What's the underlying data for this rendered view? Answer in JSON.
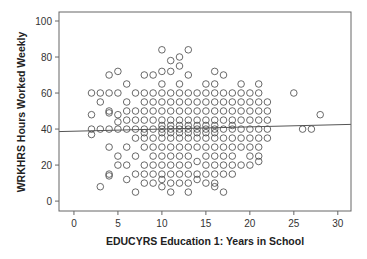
{
  "chart_data": {
    "type": "scatter",
    "title": "",
    "xlabel": "EDUCYRS Education 1: Years in School",
    "ylabel": "WRKHRS Hours Worked Weekly",
    "xlim": [
      -1.7,
      31.5
    ],
    "ylim": [
      -5.5,
      105
    ],
    "xticks": [
      0,
      5,
      10,
      15,
      20,
      25,
      30
    ],
    "yticks": [
      0,
      20,
      40,
      60,
      80,
      100
    ],
    "grid": false,
    "legend": null,
    "marker": "open-circle",
    "fit_line": {
      "type": "linear",
      "x0": -1.7,
      "y0": 38.6,
      "x1": 31.5,
      "y1": 42.6
    },
    "points": [
      [
        2,
        60
      ],
      [
        2,
        48
      ],
      [
        2,
        40
      ],
      [
        2,
        37
      ],
      [
        3,
        60
      ],
      [
        3,
        55
      ],
      [
        3,
        40
      ],
      [
        3,
        8
      ],
      [
        4,
        70
      ],
      [
        4,
        60
      ],
      [
        4,
        50
      ],
      [
        4,
        49
      ],
      [
        4,
        40
      ],
      [
        4,
        30
      ],
      [
        4,
        15
      ],
      [
        4,
        14
      ],
      [
        5,
        72
      ],
      [
        5,
        60
      ],
      [
        5,
        48
      ],
      [
        5,
        44
      ],
      [
        5,
        40
      ],
      [
        5,
        25
      ],
      [
        5,
        20
      ],
      [
        6,
        65
      ],
      [
        6,
        55
      ],
      [
        6,
        50
      ],
      [
        6,
        45
      ],
      [
        6,
        40
      ],
      [
        6,
        30
      ],
      [
        6,
        20
      ],
      [
        6,
        12
      ],
      [
        7,
        60
      ],
      [
        7,
        50
      ],
      [
        7,
        45
      ],
      [
        7,
        40
      ],
      [
        7,
        35
      ],
      [
        7,
        25
      ],
      [
        7,
        15
      ],
      [
        7,
        5
      ],
      [
        8,
        70
      ],
      [
        8,
        60
      ],
      [
        8,
        55
      ],
      [
        8,
        50
      ],
      [
        8,
        45
      ],
      [
        8,
        40
      ],
      [
        8,
        38
      ],
      [
        8,
        35
      ],
      [
        8,
        30
      ],
      [
        8,
        20
      ],
      [
        8,
        15
      ],
      [
        8,
        10
      ],
      [
        9,
        70
      ],
      [
        9,
        60
      ],
      [
        9,
        55
      ],
      [
        9,
        50
      ],
      [
        9,
        45
      ],
      [
        9,
        40
      ],
      [
        9,
        35
      ],
      [
        9,
        30
      ],
      [
        9,
        25
      ],
      [
        9,
        20
      ],
      [
        9,
        15
      ],
      [
        9,
        10
      ],
      [
        10,
        84
      ],
      [
        10,
        72
      ],
      [
        10,
        65
      ],
      [
        10,
        60
      ],
      [
        10,
        55
      ],
      [
        10,
        50
      ],
      [
        10,
        45
      ],
      [
        10,
        42
      ],
      [
        10,
        40
      ],
      [
        10,
        38
      ],
      [
        10,
        35
      ],
      [
        10,
        30
      ],
      [
        10,
        25
      ],
      [
        10,
        20
      ],
      [
        10,
        15
      ],
      [
        10,
        12
      ],
      [
        10,
        8
      ],
      [
        11,
        78
      ],
      [
        11,
        72
      ],
      [
        11,
        60
      ],
      [
        11,
        55
      ],
      [
        11,
        50
      ],
      [
        11,
        45
      ],
      [
        11,
        42
      ],
      [
        11,
        40
      ],
      [
        11,
        38
      ],
      [
        11,
        35
      ],
      [
        11,
        30
      ],
      [
        11,
        25
      ],
      [
        11,
        20
      ],
      [
        11,
        15
      ],
      [
        11,
        10
      ],
      [
        11,
        5
      ],
      [
        12,
        80
      ],
      [
        12,
        75
      ],
      [
        12,
        65
      ],
      [
        12,
        60
      ],
      [
        12,
        55
      ],
      [
        12,
        50
      ],
      [
        12,
        45
      ],
      [
        12,
        42
      ],
      [
        12,
        40
      ],
      [
        12,
        38
      ],
      [
        12,
        35
      ],
      [
        12,
        30
      ],
      [
        12,
        25
      ],
      [
        12,
        20
      ],
      [
        12,
        15
      ],
      [
        12,
        10
      ],
      [
        13,
        84
      ],
      [
        13,
        70
      ],
      [
        13,
        60
      ],
      [
        13,
        55
      ],
      [
        13,
        50
      ],
      [
        13,
        45
      ],
      [
        13,
        42
      ],
      [
        13,
        40
      ],
      [
        13,
        38
      ],
      [
        13,
        35
      ],
      [
        13,
        30
      ],
      [
        13,
        25
      ],
      [
        13,
        20
      ],
      [
        13,
        15
      ],
      [
        13,
        10
      ],
      [
        13,
        5
      ],
      [
        14,
        60
      ],
      [
        14,
        55
      ],
      [
        14,
        50
      ],
      [
        14,
        45
      ],
      [
        14,
        42
      ],
      [
        14,
        40
      ],
      [
        14,
        38
      ],
      [
        14,
        35
      ],
      [
        14,
        30
      ],
      [
        14,
        22
      ],
      [
        14,
        15
      ],
      [
        14,
        12
      ],
      [
        15,
        65
      ],
      [
        15,
        60
      ],
      [
        15,
        55
      ],
      [
        15,
        50
      ],
      [
        15,
        45
      ],
      [
        15,
        42
      ],
      [
        15,
        40
      ],
      [
        15,
        38
      ],
      [
        15,
        35
      ],
      [
        15,
        30
      ],
      [
        15,
        25
      ],
      [
        15,
        20
      ],
      [
        15,
        15
      ],
      [
        15,
        10
      ],
      [
        16,
        72
      ],
      [
        16,
        65
      ],
      [
        16,
        60
      ],
      [
        16,
        55
      ],
      [
        16,
        50
      ],
      [
        16,
        45
      ],
      [
        16,
        42
      ],
      [
        16,
        40
      ],
      [
        16,
        38
      ],
      [
        16,
        35
      ],
      [
        16,
        30
      ],
      [
        16,
        25
      ],
      [
        16,
        20
      ],
      [
        16,
        15
      ],
      [
        16,
        10
      ],
      [
        16,
        8
      ],
      [
        17,
        70
      ],
      [
        17,
        60
      ],
      [
        17,
        55
      ],
      [
        17,
        50
      ],
      [
        17,
        45
      ],
      [
        17,
        40
      ],
      [
        17,
        35
      ],
      [
        17,
        30
      ],
      [
        17,
        25
      ],
      [
        17,
        20
      ],
      [
        17,
        15
      ],
      [
        17,
        5
      ],
      [
        18,
        60
      ],
      [
        18,
        55
      ],
      [
        18,
        50
      ],
      [
        18,
        45
      ],
      [
        18,
        42
      ],
      [
        18,
        40
      ],
      [
        18,
        35
      ],
      [
        18,
        30
      ],
      [
        18,
        25
      ],
      [
        18,
        20
      ],
      [
        18,
        15
      ],
      [
        19,
        65
      ],
      [
        19,
        60
      ],
      [
        19,
        55
      ],
      [
        19,
        50
      ],
      [
        19,
        45
      ],
      [
        19,
        40
      ],
      [
        19,
        35
      ],
      [
        19,
        30
      ],
      [
        19,
        20
      ],
      [
        20,
        60
      ],
      [
        20,
        55
      ],
      [
        20,
        50
      ],
      [
        20,
        45
      ],
      [
        20,
        40
      ],
      [
        20,
        35
      ],
      [
        20,
        30
      ],
      [
        20,
        25
      ],
      [
        20,
        20
      ],
      [
        21,
        65
      ],
      [
        21,
        60
      ],
      [
        21,
        55
      ],
      [
        21,
        50
      ],
      [
        21,
        45
      ],
      [
        21,
        40
      ],
      [
        21,
        35
      ],
      [
        21,
        30
      ],
      [
        21,
        25
      ],
      [
        21,
        22
      ],
      [
        22,
        55
      ],
      [
        22,
        50
      ],
      [
        22,
        45
      ],
      [
        22,
        40
      ],
      [
        22,
        35
      ],
      [
        25,
        60
      ],
      [
        26,
        40
      ],
      [
        27,
        40
      ],
      [
        28,
        48
      ]
    ]
  }
}
